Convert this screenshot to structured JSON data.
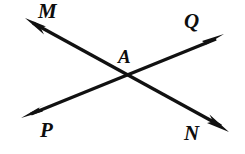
{
  "figure": {
    "background_color": "#ffffff",
    "stroke_color": "#111111",
    "stroke_width": 3.2,
    "width": 245,
    "height": 154,
    "intersection": {
      "label": "A",
      "x": 124,
      "y": 77
    },
    "labels": [
      {
        "id": "M",
        "text": "M",
        "x": 38,
        "y": 1,
        "position": "upper-left"
      },
      {
        "id": "Q",
        "text": "Q",
        "x": 184,
        "y": 11,
        "position": "upper-right"
      },
      {
        "id": "A",
        "text": "A",
        "x": 118,
        "y": 47,
        "position": "center"
      },
      {
        "id": "P",
        "text": "P",
        "x": 40,
        "y": 120,
        "position": "lower-left"
      },
      {
        "id": "N",
        "text": "N",
        "x": 184,
        "y": 123,
        "position": "lower-right"
      }
    ],
    "lines": [
      {
        "id": "line-MN",
        "name": "line-M-N",
        "from_label": "M",
        "to_label": "N",
        "endpoints": {
          "x1": 27,
          "y1": 20,
          "x2": 226,
          "y2": 129
        },
        "arrow_start": true,
        "arrow_end": true
      },
      {
        "id": "line-PQ",
        "name": "line-P-Q",
        "from_label": "P",
        "to_label": "Q",
        "endpoints": {
          "x1": 24,
          "y1": 117,
          "x2": 221,
          "y2": 36
        },
        "arrow_start": true,
        "arrow_end": true
      }
    ],
    "arrowheads": [
      {
        "id": "arrow-M",
        "tip_x": 25,
        "tip_y": 18,
        "points_to": "M"
      },
      {
        "id": "arrow-N",
        "tip_x": 228,
        "tip_y": 131,
        "points_to": "N"
      },
      {
        "id": "arrow-P",
        "tip_x": 22,
        "tip_y": 118,
        "points_to": "P"
      },
      {
        "id": "arrow-Q",
        "tip_x": 223,
        "tip_y": 34,
        "points_to": "Q"
      }
    ]
  }
}
